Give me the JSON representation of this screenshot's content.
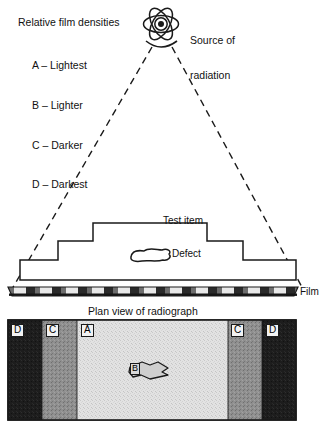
{
  "figure": {
    "legend": {
      "title": "Relative film densities",
      "entries": [
        {
          "code": "A",
          "text": "A – Lightest"
        },
        {
          "code": "B",
          "text": "B – Lighter"
        },
        {
          "code": "C",
          "text": "C – Darker"
        },
        {
          "code": "D",
          "text": "D – Darkest"
        }
      ]
    },
    "source": {
      "label_line1": "Source of",
      "label_line2": "radiation",
      "icon": "atom-icon"
    },
    "cross_section": {
      "test_item_label": "Test item",
      "defect_label": "Defect",
      "film_label": "Film"
    },
    "plan_view": {
      "title": "Plan view of radiograph",
      "bands": [
        {
          "letter": "D",
          "density": "Darkest",
          "x": 8,
          "w": 34,
          "fill": "#1b1b1b"
        },
        {
          "letter": "C",
          "density": "Darker",
          "x": 42,
          "w": 35,
          "fill": "#8e8e8e"
        },
        {
          "letter": "A",
          "density": "Lightest",
          "x": 77,
          "w": 151,
          "fill": "#dedede"
        },
        {
          "letter": "C",
          "density": "Darker",
          "x": 228,
          "w": 34,
          "fill": "#8e8e8e"
        },
        {
          "letter": "D",
          "density": "Darkest",
          "x": 262,
          "w": 34,
          "fill": "#1b1b1b"
        }
      ],
      "defect_letter": "B"
    },
    "colors": {
      "line": "#1a1a1a",
      "background": "#ffffff",
      "darkest": "#1b1b1b",
      "darker": "#8e8e8e",
      "lightest": "#dedede"
    }
  }
}
